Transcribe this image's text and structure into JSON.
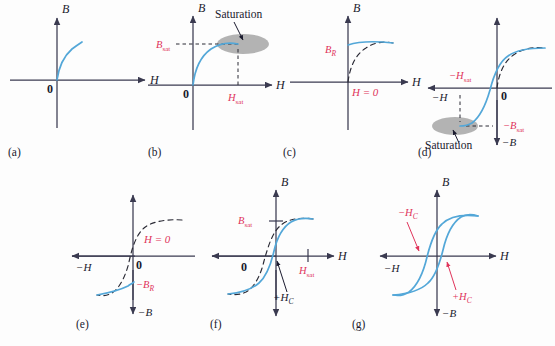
{
  "figure": {
    "colors": {
      "curve": "#53a7d8",
      "dashed_prior": "#2a2a35",
      "label_red": "#e0335a",
      "axis": "#3a3a50",
      "saturation_ellipse": "#a8a8a8",
      "background": "#fdfdfd"
    }
  },
  "axis_labels": {
    "B": "B",
    "H": "H",
    "neg_B": "−B",
    "neg_H": "−H",
    "origin": "0"
  },
  "panels": [
    {
      "id": "a",
      "label": "(a)",
      "axes": [
        "B",
        "H"
      ],
      "origin_label": "0",
      "annotations": [],
      "description": "Initial magnetization curve rising from origin into first quadrant"
    },
    {
      "id": "b",
      "label": "(b)",
      "axes": [
        "B",
        "H"
      ],
      "origin_label": "0",
      "annotations": [
        {
          "name": "B-sat-label",
          "text": "B",
          "sub": "sat",
          "color": "#e0335a"
        },
        {
          "name": "H-sat-label",
          "text": "H",
          "sub": "sat",
          "color": "#e0335a"
        },
        {
          "name": "saturation-callout",
          "text": "Saturation",
          "color": "#1a1a2e"
        }
      ],
      "description": "Curve reaches saturation at Bsat, Hsat"
    },
    {
      "id": "c",
      "label": "(c)",
      "axes": [
        "B",
        "H"
      ],
      "origin_label": "",
      "annotations": [
        {
          "name": "B-R-label",
          "text": "B",
          "sub": "R",
          "color": "#e0335a"
        },
        {
          "name": "H-zero-label",
          "text": "H = 0",
          "color": "#e0335a"
        }
      ],
      "description": "H returned to zero leaving residual flux density BR"
    },
    {
      "id": "d",
      "label": "(d)",
      "axes": [
        "B",
        "−B",
        "−H"
      ],
      "origin_label": "0",
      "annotations": [
        {
          "name": "neg-H-sat-label",
          "text": "−H",
          "sub": "sat",
          "color": "#e0335a"
        },
        {
          "name": "neg-B-sat-label",
          "text": "−B",
          "sub": "sat",
          "color": "#e0335a"
        },
        {
          "name": "saturation-callout",
          "text": "Saturation",
          "color": "#1a1a2e"
        }
      ],
      "description": "Reverse field drives material to negative saturation"
    },
    {
      "id": "e",
      "label": "(e)",
      "axes": [
        "B",
        "−B",
        "−H"
      ],
      "origin_label": "0",
      "annotations": [
        {
          "name": "H-zero-label",
          "text": "H = 0",
          "color": "#e0335a"
        },
        {
          "name": "neg-B-R-label",
          "text": "−B",
          "sub": "R",
          "color": "#e0335a"
        }
      ],
      "description": "H returned to zero from negative saturation, residual −BR"
    },
    {
      "id": "f",
      "label": "(f)",
      "axes": [
        "B",
        "−B",
        "H"
      ],
      "origin_label": "0",
      "annotations": [
        {
          "name": "B-sat-label",
          "text": "B",
          "sub": "sat",
          "color": "#e0335a"
        },
        {
          "name": "H-sat-label",
          "text": "H",
          "sub": "sat",
          "color": "#e0335a"
        },
        {
          "name": "plus-Hc-label",
          "text": "+H",
          "sub": "C",
          "color": "#1a1a2e"
        }
      ],
      "description": "Forward field again, crossing coercive point +HC back to positive saturation"
    },
    {
      "id": "g",
      "label": "(g)",
      "axes": [
        "B",
        "−B",
        "H",
        "−H"
      ],
      "origin_label": "",
      "annotations": [
        {
          "name": "neg-Hc-label",
          "text": "−H",
          "sub": "C",
          "color": "#e0335a"
        },
        {
          "name": "plus-Hc-label",
          "text": "+H",
          "sub": "C",
          "color": "#e0335a"
        }
      ],
      "description": "Complete closed hysteresis loop showing −HC and +HC coercivity"
    }
  ]
}
